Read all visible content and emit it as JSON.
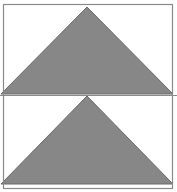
{
  "figure": {
    "canvas": {
      "width": 177,
      "height": 192,
      "background": "#ffffff"
    },
    "colors": {
      "shape_fill": "#878787",
      "shape_stroke": "#6b6b6b",
      "frame_stroke": "#8a8a8a",
      "divider_stroke": "#8a8a8a",
      "background": "#ffffff"
    },
    "frame": {
      "label": "outer-rectangle-border",
      "x": 3.5,
      "y": 4.5,
      "width": 169,
      "height": 184,
      "stroke_width": 1.2
    },
    "divider": {
      "label": "horizontal-divider-line",
      "x1": 0,
      "y1": 95.5,
      "x2": 177,
      "y2": 95.5,
      "stroke_width": 1.2
    },
    "shapes": [
      {
        "name": "upper-triangle",
        "type": "triangle",
        "orientation": "pointing-up",
        "points": "87,7 173,94 1,94",
        "apex": {
          "x": 87,
          "y": 7
        },
        "base_left": {
          "x": 1,
          "y": 94
        },
        "base_right": {
          "x": 173,
          "y": 94
        },
        "base_width": 172,
        "height": 87
      },
      {
        "name": "lower-triangle",
        "type": "triangle",
        "orientation": "pointing-up",
        "points": "87,96 173,184 1,184",
        "apex": {
          "x": 87,
          "y": 96
        },
        "base_left": {
          "x": 1,
          "y": 184
        },
        "base_right": {
          "x": 173,
          "y": 184
        },
        "base_width": 172,
        "height": 88
      }
    ]
  }
}
